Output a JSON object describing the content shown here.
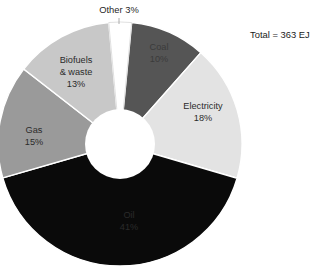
{
  "chart_data": {
    "type": "pie",
    "variant": "donut",
    "title": "",
    "subtitle": "",
    "xlabel": "",
    "ylabel": "",
    "legend_position": "none",
    "grid": false,
    "labels_inside_slices": true,
    "total_annotation": "Total = 363 EJ",
    "total_value": 363,
    "total_unit": "EJ",
    "categories": [
      "Coal",
      "Electricity",
      "Oil",
      "Gas",
      "Biofuels & waste",
      "Other"
    ],
    "values": [
      10,
      18,
      41,
      15,
      13,
      3
    ],
    "value_unit": "%",
    "colors": [
      "#555555",
      "#e3e3e3",
      "#0a0a0a",
      "#9a9a9a",
      "#c8c8c8",
      "#ffffff"
    ],
    "slices": [
      {
        "name": "Coal",
        "label_line1": "Coal",
        "label_line2": "10%",
        "value": 10,
        "color": "#555555",
        "label_placement": "inside",
        "label_fill": "#3b3b3b"
      },
      {
        "name": "Electricity",
        "label_line1": "Electricity",
        "label_line2": "18%",
        "value": 18,
        "color": "#e3e3e3",
        "label_placement": "inside",
        "label_fill": "#2b2b2b"
      },
      {
        "name": "Oil",
        "label_line1": "Oil",
        "label_line2": "41%",
        "value": 41,
        "color": "#0a0a0a",
        "label_placement": "inside",
        "label_fill": "#2a2a2a"
      },
      {
        "name": "Gas",
        "label_line1": "Gas",
        "label_line2": "15%",
        "value": 15,
        "color": "#9a9a9a",
        "label_placement": "inside",
        "label_fill": "#2b2b2b"
      },
      {
        "name": "Biofuels & waste",
        "label_line1": "Biofuels",
        "label_line2": "& waste",
        "label_line3": "13%",
        "value": 13,
        "color": "#c8c8c8",
        "label_placement": "inside",
        "label_fill": "#2b2b2b"
      },
      {
        "name": "Other",
        "label_line1": "Other 3%",
        "value": 3,
        "color": "#ffffff",
        "label_placement": "outside",
        "label_fill": "#1f1f1f"
      }
    ]
  }
}
